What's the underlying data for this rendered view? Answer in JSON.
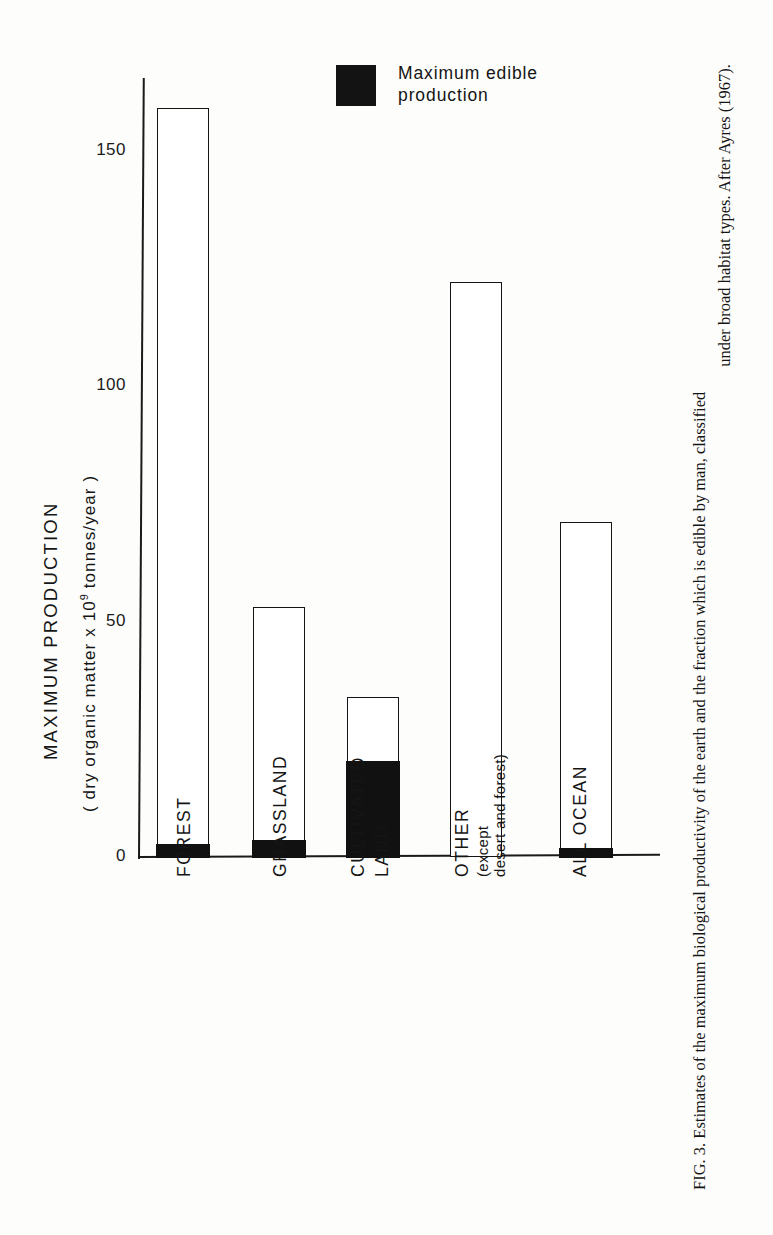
{
  "figure": {
    "caption_prefix": "FIG. 3.",
    "caption_line1": "Estimates of the maximum biological productivity of the earth and the fraction which is edible by man, classified",
    "caption_line2": "under broad habitat types. After Ayres (1967)."
  },
  "legend": {
    "swatch_color": "#131313",
    "label": "Maximum  edible\nproduction"
  },
  "axis": {
    "y_title_main": "MAXIMUM   PRODUCTION",
    "y_title_units_pre": "( dry organic matter  x  10",
    "y_title_units_sup": "9",
    "y_title_units_post": " tonnes/year )",
    "y_ticks": [
      "150",
      "100",
      "50",
      "0"
    ]
  },
  "categories": [
    {
      "label": "FOREST",
      "sub": ""
    },
    {
      "label": "GRASSLAND",
      "sub": ""
    },
    {
      "label": "CULTIVATED",
      "sub": "LAND"
    },
    {
      "label": "OTHER",
      "sub": "(except\ndesert and forest)"
    },
    {
      "label": "ALL  OCEAN",
      "sub": ""
    }
  ],
  "chart_data": {
    "type": "bar",
    "title": "",
    "xlabel": "",
    "ylabel": "MAXIMUM PRODUCTION (dry organic matter x 10^9 tonnes/year)",
    "ylim": [
      0,
      165
    ],
    "yticks": [
      0,
      50,
      100,
      150
    ],
    "grid": false,
    "legend_position": "top-center",
    "categories": [
      "FOREST",
      "GRASSLAND",
      "CULTIVATED LAND",
      "OTHER (except desert and forest)",
      "ALL OCEAN"
    ],
    "series": [
      {
        "name": "Maximum production",
        "values": [
          159,
          53,
          34,
          122,
          71
        ]
      },
      {
        "name": "Maximum edible production",
        "values": [
          2.5,
          3.5,
          20.5,
          0,
          1.5
        ]
      }
    ]
  }
}
